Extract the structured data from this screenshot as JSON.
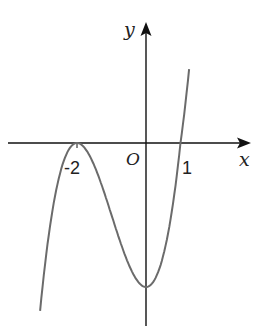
{
  "chart_data": {
    "type": "line",
    "title": "",
    "function": "y = (x+2)^2 (x-1)",
    "xlabel": "x",
    "ylabel": "y",
    "origin_label": "O",
    "tick_labels": [
      "-2",
      "1"
    ],
    "key_points": [
      {
        "x": -2,
        "y": 0,
        "note": "local maximum, tangent to x-axis"
      },
      {
        "x": 0,
        "y": -4,
        "note": "local minimum"
      },
      {
        "x": 1,
        "y": 0,
        "note": "x-intercept"
      }
    ],
    "xlim": [
      -3.1,
      1.3
    ],
    "grid": false,
    "legend": null,
    "colors": {
      "axis": "#111111",
      "curve": "#6b6b6b"
    }
  },
  "pixel_map": {
    "origin": [
      146,
      143
    ],
    "x_unit": 34.5,
    "y_unit": 36
  }
}
